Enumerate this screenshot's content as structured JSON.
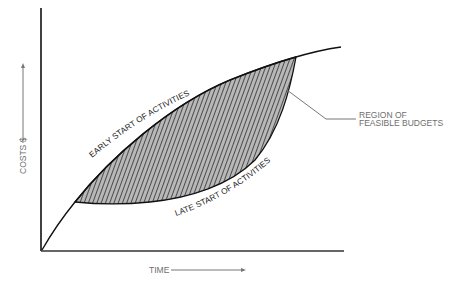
{
  "diagram": {
    "y_axis": {
      "label": "COSTS $",
      "arrow": "up-arrow"
    },
    "x_axis": {
      "label": "TIME",
      "arrow": "right-arrow"
    },
    "curves": {
      "early": {
        "label": "EARLY START OF ACTIVITIES"
      },
      "late": {
        "label": "LATE START OF ACTIVITIES"
      }
    },
    "region": {
      "label_line1": "REGION OF",
      "label_line2": "FEASIBLE BUDGETS",
      "fill_color": "#b8b8b8",
      "hatch_color": "#111111"
    },
    "colors": {
      "axis": "#111111",
      "label_gray": "#6e6e6e"
    }
  }
}
